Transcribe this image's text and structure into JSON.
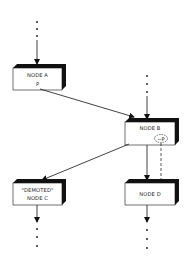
{
  "diagram": {
    "nodes": [
      {
        "id": "A",
        "lines": [
          "NODE A",
          "P"
        ]
      },
      {
        "id": "B",
        "lines": [
          "NODE B"
        ],
        "annotation": "~P"
      },
      {
        "id": "C",
        "lines": [
          "\"DEMOTED\"",
          "NODE C"
        ]
      },
      {
        "id": "D",
        "lines": [
          "NODE D"
        ]
      }
    ],
    "edges": [
      {
        "from": "above",
        "to": "A",
        "style": "dotted-then-arrow"
      },
      {
        "from": "A",
        "to": "B",
        "style": "solid-arrow"
      },
      {
        "from": "above",
        "to": "B",
        "style": "dotted-then-arrow"
      },
      {
        "from": "B",
        "to": "C",
        "style": "solid-arrow"
      },
      {
        "from": "B",
        "to": "D",
        "style": "solid-arrow"
      },
      {
        "from": "B.~P",
        "to": "D",
        "style": "dashed"
      },
      {
        "from": "C",
        "to": "below",
        "style": "arrow-then-dotted"
      },
      {
        "from": "D",
        "to": "below",
        "style": "arrow-then-dotted"
      }
    ],
    "colors": {
      "ink": "#111111",
      "box_fill": "#ffffff",
      "shadow": "#111111"
    }
  }
}
